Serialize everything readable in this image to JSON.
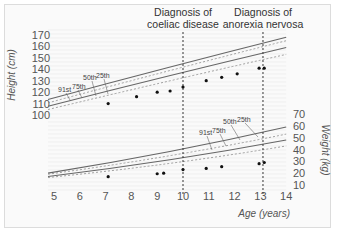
{
  "chart_data": {
    "type": "line",
    "title": "",
    "xlabel": "Age (years)",
    "x_ticks": [
      5,
      6,
      7,
      8,
      9,
      10,
      11,
      12,
      13,
      14
    ],
    "xlim": [
      5,
      14
    ],
    "grid": "horizontal faint",
    "panels": [
      {
        "name": "height",
        "ylabel": "Height (cm)",
        "y_axis_side": "left",
        "y_ticks": [
          100,
          110,
          120,
          130,
          140,
          150,
          160,
          170
        ],
        "ylim": [
          100,
          170
        ],
        "percentile_curves": [
          {
            "name": "91st",
            "style": "solid",
            "x": [
              5,
              14
            ],
            "values": [
              115,
              168
            ]
          },
          {
            "name": "75th",
            "style": "dashed",
            "x": [
              5,
              14
            ],
            "values": [
              112,
              165
            ]
          },
          {
            "name": "50th",
            "style": "solid",
            "x": [
              5,
              14
            ],
            "values": [
              109,
              159
            ]
          },
          {
            "name": "25th",
            "style": "dashed",
            "x": [
              5,
              14
            ],
            "values": [
              106,
              153
            ]
          }
        ],
        "measurements": {
          "x": [
            7.1,
            8.2,
            9.0,
            9.5,
            10.0,
            10.9,
            11.5,
            12.1,
            12.95,
            13.15
          ],
          "values": [
            110,
            116,
            120,
            121,
            124.5,
            130,
            133,
            136,
            141,
            141
          ]
        },
        "curve_labels": [
          "91st",
          "75th",
          "50th",
          "25th"
        ]
      },
      {
        "name": "weight",
        "ylabel": "Weight (kg)",
        "y_axis_side": "right",
        "y_ticks": [
          10,
          20,
          30,
          40,
          50,
          60,
          70
        ],
        "ylim": [
          10,
          70
        ],
        "percentile_curves": [
          {
            "name": "91st",
            "style": "solid",
            "x": [
              5,
              14
            ],
            "values": [
              21,
              59
            ]
          },
          {
            "name": "75th",
            "style": "dashed",
            "x": [
              5,
              14
            ],
            "values": [
              20,
              53
            ]
          },
          {
            "name": "50th",
            "style": "solid",
            "x": [
              5,
              14
            ],
            "values": [
              18,
              48
            ]
          },
          {
            "name": "25th",
            "style": "dashed",
            "x": [
              5,
              14
            ],
            "values": [
              17,
              43
            ]
          }
        ],
        "measurements": {
          "x": [
            7.1,
            9.0,
            9.25,
            10.0,
            10.9,
            11.5,
            12.95,
            13.15
          ],
          "values": [
            17,
            19.5,
            20,
            23,
            24,
            25.5,
            28,
            29
          ]
        },
        "curve_labels": [
          "91st",
          "75th",
          "50th",
          "25th"
        ]
      }
    ],
    "annotations": [
      {
        "x": 10,
        "text": "Diagnosis of coeliac disease",
        "style": "vertical dotted line"
      },
      {
        "x": 13.1,
        "text": "Diagnosis of anorexia nervosa",
        "style": "vertical dotted line"
      }
    ]
  },
  "labels": {
    "height_axis": "Height (cm)",
    "weight_axis": "Weight (kg)",
    "age_axis": "Age (years)",
    "annot1_line1": "Diagnosis of",
    "annot1_line2": "coeliac disease",
    "annot2_line1": "Diagnosis of",
    "annot2_line2": "anorexia nervosa",
    "p91": "91st",
    "p75": "75th",
    "p50": "50th",
    "p25": "25th"
  }
}
